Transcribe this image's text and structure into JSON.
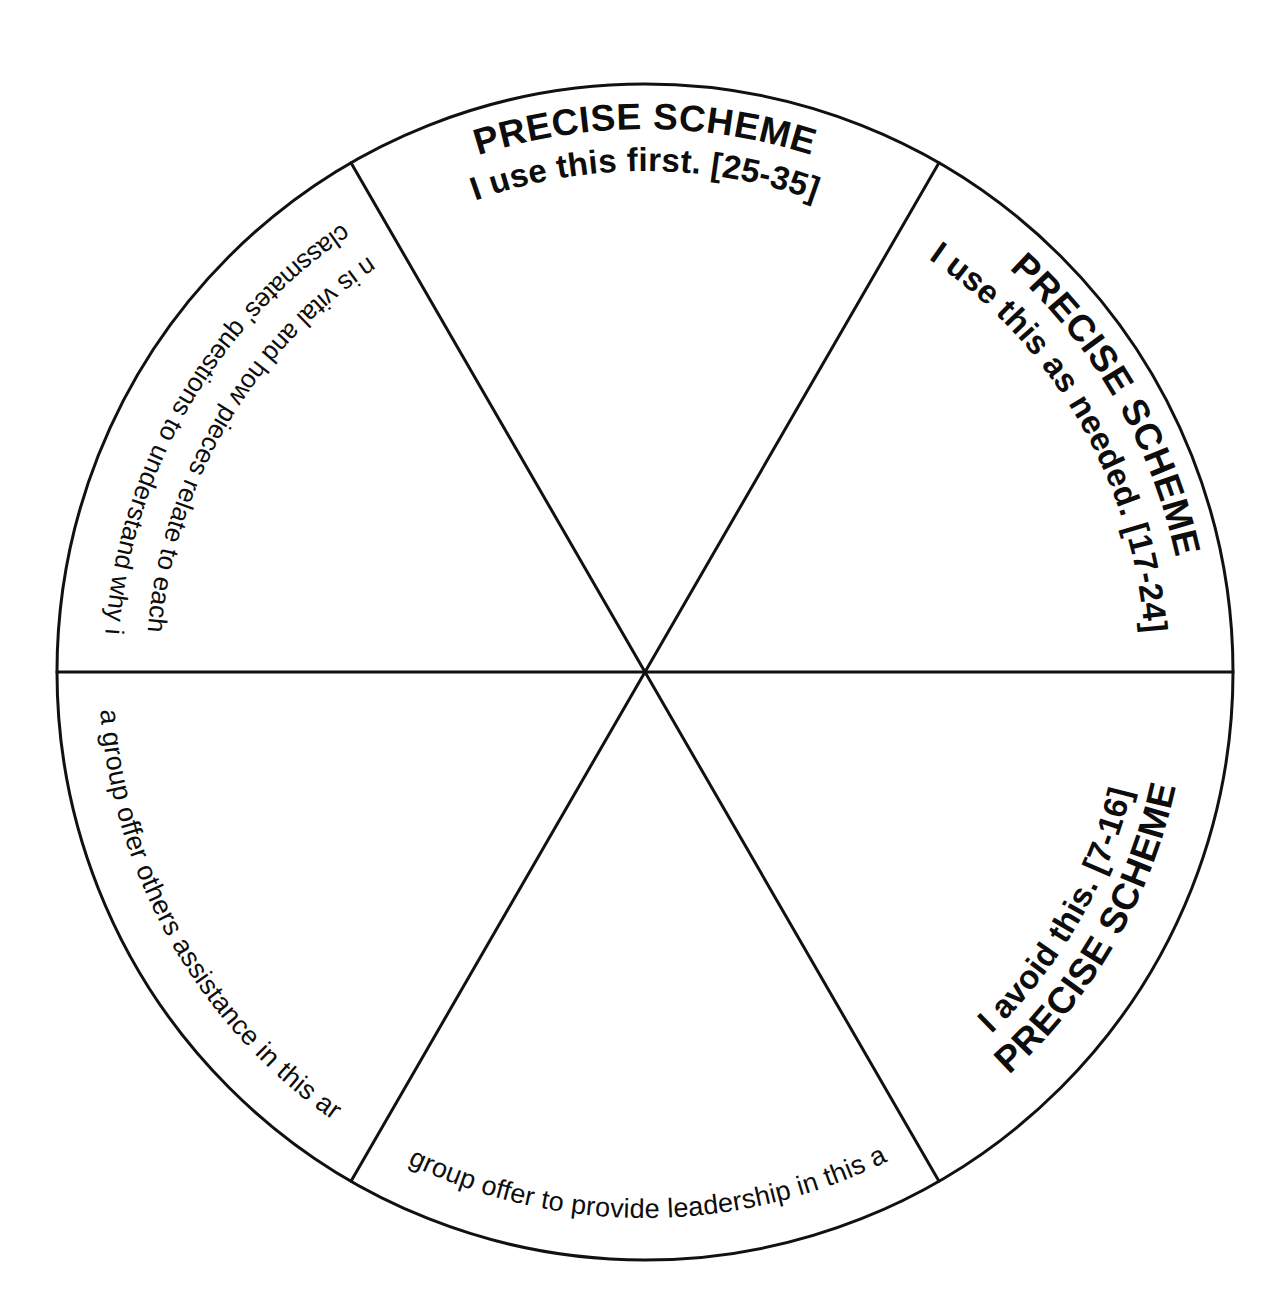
{
  "diagram": {
    "shape": "circle",
    "sector_count": 6,
    "stroke_color": "#111111",
    "background_color": "#ffffff",
    "text_color": "#0d0d0d",
    "center_x": 645,
    "center_y": 672,
    "radius": 588
  },
  "sectors": [
    {
      "id": "top",
      "position": "top",
      "angle_start": -120,
      "angle_end": -60,
      "heading": "PRECISE SCHEME",
      "subheading": "I use this first. [25-35]",
      "range_label": "[25-35]",
      "orientation": "upright"
    },
    {
      "id": "upper-right",
      "position": "upper-right",
      "angle_start": -60,
      "angle_end": 0,
      "heading": "PRECISE SCHEME",
      "subheading": "I use this as needed. [17-24]",
      "range_label": "[17-24]",
      "orientation": "upright"
    },
    {
      "id": "lower-right",
      "position": "lower-right",
      "angle_start": 0,
      "angle_end": 60,
      "heading": "PRECISE SCHEME",
      "subheading": "I avoid this. [7-16]",
      "range_label": "[7-16]",
      "orientation": "inverted"
    },
    {
      "id": "bottom",
      "position": "bottom",
      "angle_start": 60,
      "angle_end": 120,
      "body": "In a group offer to provide leadership in this area.",
      "orientation": "upright"
    },
    {
      "id": "lower-left",
      "position": "lower-left",
      "angle_start": 120,
      "angle_end": 180,
      "body": "In a group offer others assistance in this area.",
      "orientation": "upright"
    },
    {
      "id": "upper-left",
      "position": "upper-left",
      "angle_start": 180,
      "angle_end": 240,
      "body_line1": "Use classmates' questions to understand why infor-",
      "body_line2": "mation is vital and how pieces relate to each other.",
      "orientation": "inverted"
    }
  ]
}
